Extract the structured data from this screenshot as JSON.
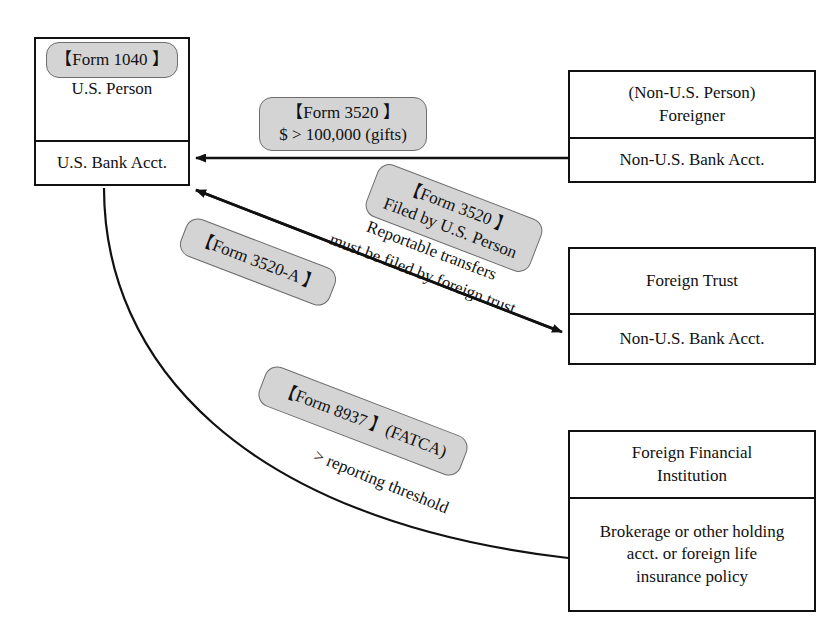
{
  "diagram": {
    "colors": {
      "tag_fill": "#d4d4d4",
      "tag_border": "#6d6d6d",
      "box_border": "#111111",
      "background": "#ffffff",
      "text": "#111111"
    },
    "entities": [
      {
        "id": "us-person",
        "head_lines": [
          "U.S. Person"
        ],
        "body_lines": [
          "U.S. Bank Acct."
        ]
      },
      {
        "id": "foreigner",
        "head_lines": [
          "(Non-U.S. Person)",
          "Foreigner"
        ],
        "body_lines": [
          "Non-U.S. Bank Acct."
        ]
      },
      {
        "id": "foreign-trust",
        "head_lines": [
          "Foreign Trust"
        ],
        "body_lines": [
          "Non-U.S. Bank Acct."
        ]
      },
      {
        "id": "foreign-financial-institution",
        "head_lines": [
          "Foreign Financial",
          "Institution"
        ],
        "body_lines": [
          "Brokerage or other holding",
          "acct. or foreign life",
          "insurance policy"
        ]
      }
    ],
    "form_tags": [
      {
        "id": "form-1040",
        "lines": [
          "【Form 1040 】"
        ]
      },
      {
        "id": "form-3520-gift",
        "lines": [
          "【Form 3520 】",
          "$ > 100,000 (gifts)"
        ]
      },
      {
        "id": "form-3520-trust",
        "lines": [
          "【Form 3520 】",
          "Filed by U.S. Person"
        ]
      },
      {
        "id": "form-3520-a",
        "lines": [
          "【Form 3520-A 】"
        ]
      },
      {
        "id": "form-8937-fatca",
        "lines": [
          "【Form 8937 】(FATCA)"
        ]
      }
    ],
    "annotations": [
      {
        "id": "reportable-transfers",
        "lines": [
          "Reportable transfers",
          "must be filed by foreign trust"
        ]
      },
      {
        "id": "reporting-threshold",
        "lines": [
          "> reporting threshold"
        ]
      }
    ]
  }
}
